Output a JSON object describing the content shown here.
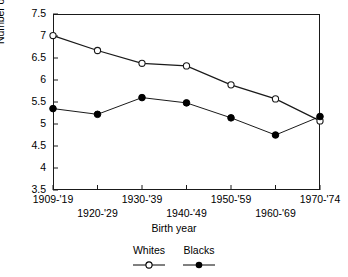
{
  "chart_data": {
    "type": "line",
    "title": "",
    "xlabel": "Birth year",
    "ylabel": "Number of correct items",
    "categories": [
      "1909-'19",
      "1920-'29",
      "1930-'39",
      "1940-'49",
      "1950-'59",
      "1960-'69",
      "1970-'74"
    ],
    "ylim": [
      3.5,
      7.5
    ],
    "yticks": [
      "3.5",
      "4",
      "4.5",
      "5",
      "5.5",
      "6",
      "6.5",
      "7",
      "7.5"
    ],
    "ytick_values": [
      3.5,
      4,
      4.5,
      5,
      5.5,
      6,
      6.5,
      7,
      7.5
    ],
    "grid": false,
    "legend_position": "bottom",
    "series": [
      {
        "name": "Whites",
        "marker": "open-circle",
        "values": [
          7.01,
          6.67,
          6.38,
          6.32,
          5.89,
          5.57,
          5.07
        ]
      },
      {
        "name": "Blacks",
        "marker": "filled-circle",
        "values": [
          5.35,
          5.22,
          5.6,
          5.48,
          5.14,
          4.75,
          5.17
        ]
      }
    ]
  },
  "legend": {
    "entries": [
      {
        "label": "Whites",
        "marker": "open-circle"
      },
      {
        "label": "Blacks",
        "marker": "filled-circle"
      }
    ]
  },
  "colors": {
    "axis": "#1a1a1a",
    "series_whites": "#1a1a1a",
    "series_blacks": "#000000",
    "background": "#ffffff"
  }
}
